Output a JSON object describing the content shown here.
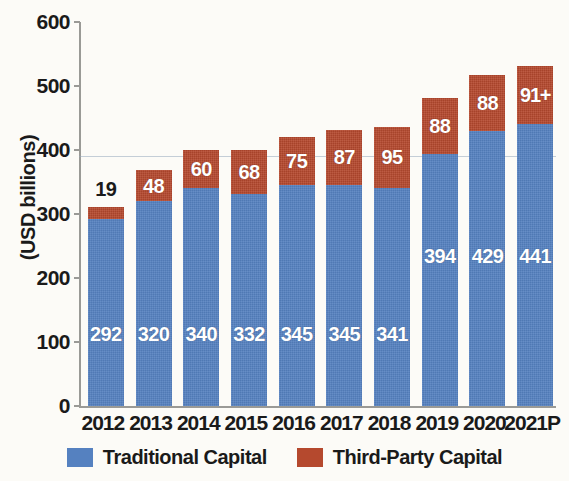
{
  "chart_data": {
    "type": "bar",
    "stacked": true,
    "title": "",
    "subtitle": "",
    "xlabel": "",
    "ylabel": "(USD billions)",
    "ylim": [
      0,
      600
    ],
    "yticks": [
      0,
      100,
      200,
      300,
      400,
      500,
      600
    ],
    "ytick_labels": [
      "0",
      "100",
      "200",
      "300",
      "400",
      "500",
      "600"
    ],
    "grid": false,
    "legend_position": "bottom",
    "categories": [
      "2012",
      "2013",
      "2014",
      "2015",
      "2016",
      "2017",
      "2018",
      "2019",
      "2020",
      "2021P"
    ],
    "series": [
      {
        "name": "Traditional Capital",
        "color": "#5581c0",
        "values": [
          292,
          320,
          340,
          332,
          345,
          345,
          341,
          394,
          429,
          441
        ],
        "labels": [
          "292",
          "320",
          "340",
          "332",
          "345",
          "345",
          "341",
          "394",
          "429",
          "441"
        ]
      },
      {
        "name": "Third-Party Capital",
        "color": "#b5492e",
        "values": [
          19,
          48,
          60,
          68,
          75,
          87,
          95,
          88,
          88,
          91
        ],
        "labels": [
          "19",
          "48",
          "60",
          "68",
          "75",
          "87",
          "95",
          "88",
          "88",
          "91+"
        ]
      }
    ],
    "totals": [
      311,
      368,
      400,
      400,
      420,
      432,
      436,
      482,
      517,
      532
    ]
  },
  "legend": {
    "items": [
      {
        "label": "Traditional Capital",
        "color": "#5581c0",
        "swatch": "blue"
      },
      {
        "label": "Third-Party Capital",
        "color": "#b5492e",
        "swatch": "red"
      }
    ]
  },
  "colors": {
    "blue": "#5581c0",
    "red": "#b5492e",
    "axis": "#9a9a96",
    "text": "#1a1a1a",
    "background": "#fcfbf7"
  }
}
